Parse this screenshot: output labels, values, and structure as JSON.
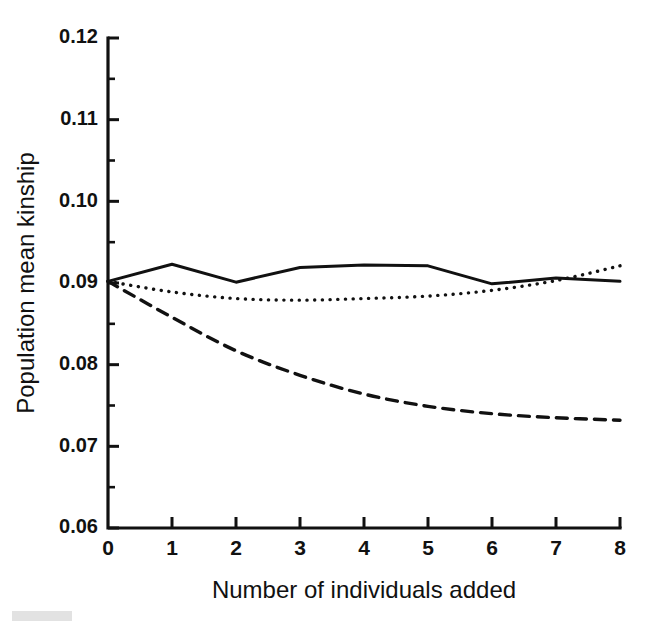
{
  "chart_data": {
    "type": "line",
    "title": "",
    "xlabel": "Number of individuals added",
    "ylabel": "Population mean kinship",
    "xlim": [
      0,
      8
    ],
    "ylim": [
      0.06,
      0.12
    ],
    "grid": false,
    "legend": "none",
    "x_ticks": [
      "0",
      "1",
      "2",
      "3",
      "4",
      "5",
      "6",
      "7",
      "8"
    ],
    "x_tick_values": [
      0,
      1,
      2,
      3,
      4,
      5,
      6,
      7,
      8
    ],
    "y_ticks": [
      "0.12",
      "0.11",
      "0.10",
      "0.09",
      "0.08",
      "0.07",
      "0.06"
    ],
    "y_tick_values": [
      0.12,
      0.11,
      0.1,
      0.09,
      0.08,
      0.07,
      0.06
    ],
    "y_minor_tick_values": [
      0.115,
      0.105,
      0.095,
      0.085,
      0.075,
      0.065
    ],
    "x": [
      0,
      1,
      2,
      3,
      4,
      5,
      6,
      7,
      8
    ],
    "series": [
      {
        "name": "solid",
        "style": "solid",
        "color": "#111111",
        "values": [
          0.0902,
          0.0923,
          0.0901,
          0.0919,
          0.0922,
          0.0921,
          0.0899,
          0.0906,
          0.0902
        ]
      },
      {
        "name": "dotted",
        "style": "dotted",
        "color": "#111111",
        "values": [
          0.0902,
          0.0889,
          0.0881,
          0.0879,
          0.0881,
          0.0884,
          0.0891,
          0.0903,
          0.0921
        ]
      },
      {
        "name": "dashed",
        "style": "dashed",
        "color": "#111111",
        "values": [
          0.0902,
          0.0858,
          0.0817,
          0.0787,
          0.0764,
          0.0749,
          0.074,
          0.0735,
          0.0732
        ]
      }
    ]
  },
  "figure": {
    "background": "#ffffff",
    "foreground": "#111111"
  }
}
